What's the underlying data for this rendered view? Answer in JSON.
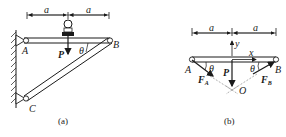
{
  "figure_a": {
    "caption": "(a)",
    "dim_left": "a",
    "dim_right": "a",
    "point_A": "A",
    "point_B": "B",
    "point_C": "C",
    "force_P": "P",
    "angle": "θ"
  },
  "figure_b": {
    "caption": "(b)",
    "dim_left": "a",
    "dim_right": "a",
    "point_A": "A",
    "point_B": "B",
    "point_O": "O",
    "axis_x": "x",
    "axis_y": "y",
    "force_P": "P",
    "force_FA": "F",
    "force_FA_sub": "A",
    "force_FB": "F",
    "force_FB_sub": "B",
    "angle_left": "θ",
    "angle_right": "θ"
  },
  "colors": {
    "ink": "#1a1a1a",
    "dash": "#777777"
  }
}
